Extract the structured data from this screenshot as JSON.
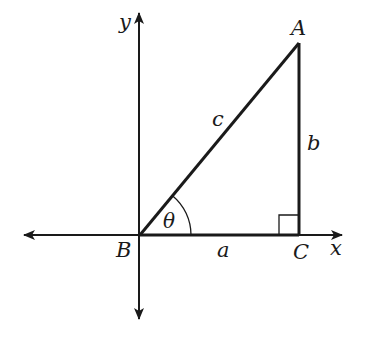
{
  "diagram": {
    "type": "right-triangle-on-axes",
    "colors": {
      "stroke": "#1a1a1a",
      "background": "#ffffff"
    },
    "axes": {
      "x_label": "x",
      "y_label": "y"
    },
    "vertices": {
      "A": "A",
      "B": "B",
      "C": "C"
    },
    "sides": {
      "hypotenuse": "c",
      "opposite": "b",
      "adjacent": "a"
    },
    "angle": {
      "label": "θ",
      "at_vertex": "B"
    },
    "right_angle_at": "C"
  }
}
